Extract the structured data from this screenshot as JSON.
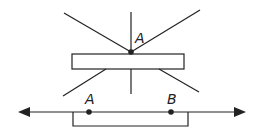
{
  "diagram": {
    "top_figure": {
      "point_label": "A",
      "description": "Lines radiating through point A on top of a rectangle"
    },
    "bottom_figure": {
      "point_labels": [
        "A",
        "B"
      ],
      "description": "Number line with arrows, points A and B, and a bracket below segment"
    },
    "colors": {
      "stroke": "#222222",
      "background": "#ffffff"
    }
  }
}
